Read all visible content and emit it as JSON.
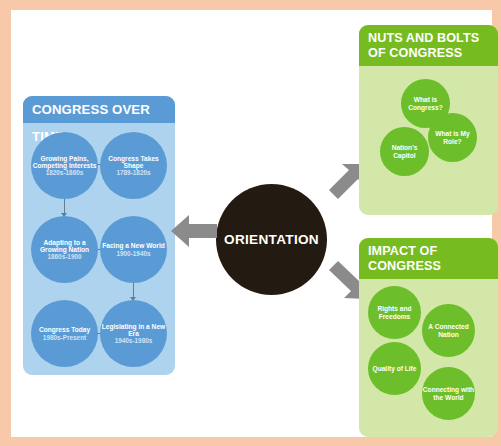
{
  "poster": {
    "border_color": "#f7c9a8",
    "canvas_color": "#ffffff"
  },
  "center": {
    "label": "ORIENTATION",
    "color": "#231a12",
    "text_color": "#ffffff"
  },
  "arrows": {
    "color": "#8b8b8b",
    "items": [
      {
        "name": "arrow-to-congress-over-time",
        "direction": "left"
      },
      {
        "name": "arrow-to-nuts-and-bolts",
        "direction": "up-right"
      },
      {
        "name": "arrow-to-impact-of-congress",
        "direction": "down-right"
      }
    ]
  },
  "panels": {
    "congress_over_time": {
      "title": "CONGRESS OVER TIME",
      "header_color": "#5b9bd5",
      "body_color": "#aed3ef",
      "bubble_color": "#5b9bd5",
      "bubbles": [
        {
          "title": "Growing Pains, Competing Interests",
          "era": "1820s-1860s"
        },
        {
          "title": "Congress Takes Shape",
          "era": "1789-1820s"
        },
        {
          "title": "Adapting to a Growing Nation",
          "era": "1860s-1900"
        },
        {
          "title": "Facing a New World",
          "era": "1900-1940s"
        },
        {
          "title": "Congress Today",
          "era": "1980s-Present"
        },
        {
          "title": "Legislating in a New Era",
          "era": "1940s-1980s"
        }
      ]
    },
    "nuts_and_bolts": {
      "title": "NUTS AND BOLTS OF CONGRESS",
      "header_color": "#76bc21",
      "body_color": "#d3e8a8",
      "bubble_color": "#6cbe2a",
      "bubbles": [
        {
          "title": "What is Congress?"
        },
        {
          "title": "Nation's Capitol"
        },
        {
          "title": "What is My Role?"
        }
      ]
    },
    "impact_of_congress": {
      "title": "IMPACT OF CONGRESS",
      "header_color": "#76bc21",
      "body_color": "#d3e8a8",
      "bubble_color": "#6cbe2a",
      "bubbles": [
        {
          "title": "Rights and Freedoms"
        },
        {
          "title": "A Connected Nation"
        },
        {
          "title": "Quality of Life"
        },
        {
          "title": "Connecting with the World"
        }
      ]
    }
  }
}
